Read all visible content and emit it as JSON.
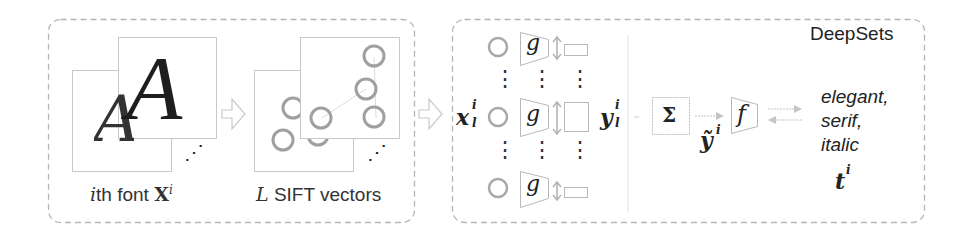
{
  "diagram": {
    "panels": {
      "font": {
        "label_prefix": "i",
        "label_text": "th font ",
        "label_symbol": "X",
        "label_sup": "i",
        "glyph_front": "A",
        "glyph_back": "A",
        "ellipsis": "⋰"
      },
      "sift": {
        "label_symbol": "L",
        "label_text": " SIFT vectors",
        "ellipsis": "⋰"
      },
      "deepsets": {
        "title": "DeepSets",
        "input_symbol": "x",
        "input_sup": "i",
        "input_sub": "l",
        "g_label": "g",
        "output_symbol": "y",
        "output_sup": "i",
        "output_sub": "l",
        "sum_label": "Σ",
        "agg_symbol": "ỹ",
        "agg_sup": "i",
        "f_label": "f",
        "tags": [
          "elegant,",
          "serif,",
          "italic"
        ],
        "tag_symbol": "t",
        "tag_sup": "i",
        "vdots": "⋮"
      }
    },
    "colors": {
      "border": "#b0b0b0",
      "circle": "#a0a0a0",
      "arrow": "#c8c8c8",
      "text": "#222222"
    }
  }
}
